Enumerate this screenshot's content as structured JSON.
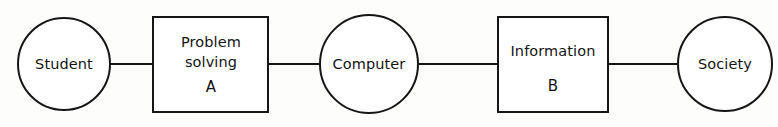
{
  "diagram": {
    "type": "linear-flow-chain",
    "background_color": "#fdfdfb",
    "stroke_color": "#161616",
    "fill_color": "#ffffff",
    "nodes": [
      {
        "id": "student",
        "shape": "circle",
        "label": "Student",
        "sublabel": "",
        "cx": 64,
        "cy": 64,
        "r": 46
      },
      {
        "id": "problem-solving",
        "shape": "rectangle",
        "label_line1": "Problem",
        "label_line2": "solving",
        "sublabel": "A",
        "x": 153,
        "y": 17,
        "width": 115,
        "height": 95
      },
      {
        "id": "computer",
        "shape": "circle",
        "label": "Computer",
        "sublabel": "",
        "cx": 369,
        "cy": 64,
        "r": 49
      },
      {
        "id": "information",
        "shape": "rectangle",
        "label_line1": "Information",
        "label_line2": "",
        "sublabel": "B",
        "x": 498,
        "y": 17,
        "width": 110,
        "height": 95
      },
      {
        "id": "society",
        "shape": "circle",
        "label": "Society",
        "sublabel": "",
        "cx": 725,
        "cy": 64,
        "r": 47
      }
    ],
    "connectors": [
      {
        "id": "student-to-problem",
        "from": "student",
        "to": "problem-solving",
        "x1": 110,
        "x2": 153,
        "y": 64
      },
      {
        "id": "problem-to-computer",
        "from": "problem-solving",
        "to": "computer",
        "x1": 268,
        "x2": 320,
        "y": 64
      },
      {
        "id": "computer-to-information",
        "from": "computer",
        "to": "information",
        "x1": 418,
        "x2": 498,
        "y": 64
      },
      {
        "id": "information-to-society",
        "from": "information",
        "to": "society",
        "x1": 608,
        "x2": 678,
        "y": 64
      }
    ]
  }
}
